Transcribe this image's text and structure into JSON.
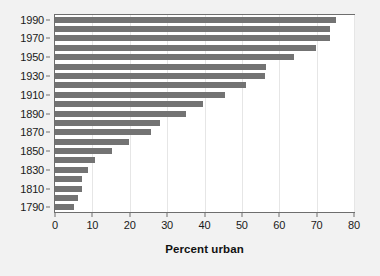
{
  "chart_data": {
    "type": "bar",
    "orientation": "horizontal",
    "title": "",
    "xlabel": "Percent urban",
    "ylabel": "",
    "xlim": [
      0,
      80
    ],
    "xticks": [
      0,
      10,
      20,
      30,
      40,
      50,
      60,
      70,
      80
    ],
    "yticks": [
      1790,
      1810,
      1830,
      1850,
      1870,
      1890,
      1910,
      1930,
      1950,
      1970,
      1990
    ],
    "grid": true,
    "grid_axis": "x",
    "legend": false,
    "bar_color": "#737373",
    "plot_background": "#ffffff",
    "figure_background": "#f2f2f2",
    "categories": [
      1790,
      1800,
      1810,
      1820,
      1830,
      1840,
      1850,
      1860,
      1870,
      1880,
      1890,
      1900,
      1910,
      1920,
      1930,
      1940,
      1950,
      1960,
      1970,
      1980,
      1990
    ],
    "values": [
      5.1,
      6.1,
      7.3,
      7.2,
      8.8,
      10.8,
      15.3,
      19.8,
      25.7,
      28.2,
      35.1,
      39.6,
      45.6,
      51.2,
      56.1,
      56.5,
      64.0,
      69.9,
      73.6,
      73.7,
      75.2
    ]
  },
  "axis": {
    "x_title": "Percent urban"
  }
}
